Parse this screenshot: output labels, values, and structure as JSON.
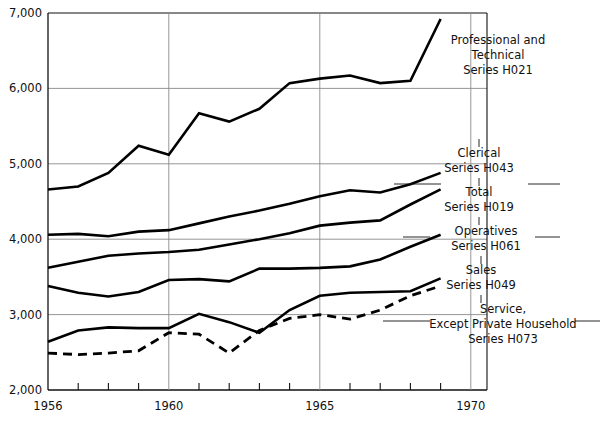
{
  "chart_data": {
    "type": "line",
    "title": "",
    "subtitle": "",
    "xlabel": "",
    "ylabel": "",
    "xlim": [
      1955.5,
      1970.8
    ],
    "ylim": [
      2000,
      7000
    ],
    "grid": true,
    "legend_position": "inline-right-annotations",
    "y_ticks": [
      2000,
      3000,
      4000,
      5000,
      6000,
      7000
    ],
    "y_tick_labels": [
      "2,000",
      "3,000",
      "4,000",
      "5,000",
      "6,000",
      "7,000"
    ],
    "x_ticks": [
      1956,
      1957,
      1958,
      1959,
      1960,
      1961,
      1962,
      1963,
      1964,
      1965,
      1966,
      1967,
      1968,
      1969,
      1970
    ],
    "x_tick_labels_shown": [
      "1956",
      "1960",
      "1965",
      "1970"
    ],
    "x": [
      1956,
      1957,
      1958,
      1959,
      1960,
      1961,
      1962,
      1963,
      1964,
      1965,
      1966,
      1967,
      1968,
      1969
    ],
    "series": [
      {
        "name": "Professional and Technical",
        "code": "H021",
        "label_lines": [
          "Professional and",
          "Technical",
          "Series H021"
        ],
        "style": "solid",
        "values": [
          4660,
          4700,
          4880,
          5240,
          5120,
          5670,
          5560,
          5730,
          6070,
          6130,
          6170,
          6070,
          6100,
          6920
        ]
      },
      {
        "name": "Clerical",
        "code": "H043",
        "label_lines": [
          "Clerical",
          "Series H043"
        ],
        "style": "solid",
        "values": [
          4060,
          4070,
          4040,
          4100,
          4120,
          4210,
          4300,
          4380,
          4470,
          4570,
          4650,
          4620,
          4730,
          4880
        ]
      },
      {
        "name": "Total",
        "code": "H019",
        "label_lines": [
          "Total",
          "Series H019"
        ],
        "style": "solid",
        "values": [
          3620,
          3700,
          3780,
          3810,
          3830,
          3860,
          3930,
          4000,
          4080,
          4180,
          4220,
          4250,
          4460,
          4660
        ]
      },
      {
        "name": "Operatives",
        "code": "H061",
        "label_lines": [
          "Operatives",
          "Series H061"
        ],
        "style": "solid",
        "values": [
          3380,
          3290,
          3240,
          3300,
          3460,
          3470,
          3440,
          3610,
          3610,
          3620,
          3640,
          3730,
          3900,
          4060
        ]
      },
      {
        "name": "Sales",
        "code": "H049",
        "label_lines": [
          "Sales",
          "Series H049"
        ],
        "style": "solid",
        "values": [
          2640,
          2790,
          2830,
          2820,
          2820,
          3010,
          2900,
          2760,
          3060,
          3250,
          3290,
          3300,
          3310,
          3480
        ]
      },
      {
        "name": "Service, Except Private Household",
        "code": "H073",
        "label_lines": [
          "Service,",
          "Except Private Household",
          "Series H073"
        ],
        "style": "dashed",
        "values": [
          2490,
          2470,
          2490,
          2520,
          2760,
          2740,
          2490,
          2790,
          2950,
          3000,
          2940,
          3060,
          3250,
          3380
        ]
      }
    ],
    "annotations": [
      {
        "id": "ann-h021",
        "code": "H021",
        "lines": [
          "Professional and",
          "Technical",
          "Series H021"
        ]
      },
      {
        "id": "ann-h043",
        "code": "H043",
        "lines": [
          "Clerical",
          "Series H043"
        ]
      },
      {
        "id": "ann-h019",
        "code": "H019",
        "lines": [
          "Total",
          "Series H019"
        ]
      },
      {
        "id": "ann-h061",
        "code": "H061",
        "lines": [
          "Operatives",
          "Series H061"
        ]
      },
      {
        "id": "ann-h049",
        "code": "H049",
        "lines": [
          "Sales",
          "Series H049"
        ]
      },
      {
        "id": "ann-h073",
        "code": "H073",
        "lines": [
          "Service,",
          "Except Private Household",
          "Series H073"
        ]
      }
    ],
    "colors": {
      "line": "#000000",
      "grid": "#8a8a8a",
      "frame": "#111111",
      "background": "#ffffff",
      "text": "#111111"
    }
  }
}
